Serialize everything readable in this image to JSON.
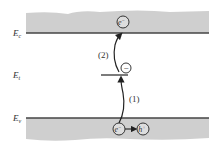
{
  "diagram": {
    "type": "energy-band",
    "levels": {
      "conduction": {
        "label": "E",
        "subscript": "c"
      },
      "trap": {
        "label": "E",
        "subscript": "t"
      },
      "valence": {
        "label": "E",
        "subscript": "v"
      }
    },
    "transitions": [
      {
        "label": "(1)",
        "from": "valence",
        "to": "trap"
      },
      {
        "label": "(2)",
        "from": "trap",
        "to": "conduction"
      }
    ],
    "particles": {
      "conduction_electron": {
        "label": "e",
        "superscript": "−"
      },
      "trapped_electron": {
        "symbol": "−"
      },
      "valence_electron": {
        "label": "e",
        "superscript": "−"
      },
      "valence_hole": {
        "label": "h",
        "superscript": "+"
      }
    },
    "colors": {
      "band_fill": "#cfcfcf",
      "band_edge": "#444444",
      "stroke": "#222222"
    }
  }
}
